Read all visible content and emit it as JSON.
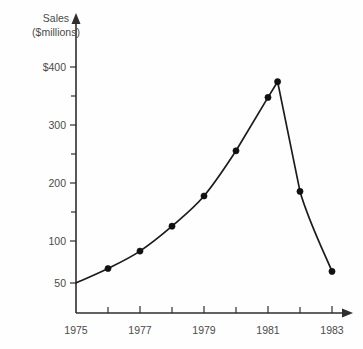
{
  "chart_data": {
    "type": "line",
    "title": "",
    "ylabel": "Sales\n($millions)",
    "ylabel_line1": "Sales",
    "ylabel_line2": "($millions)",
    "xlabel": "",
    "x": [
      1975,
      1976,
      1977,
      1978,
      1979,
      1980,
      1981,
      1981.3,
      1982,
      1983
    ],
    "values": [
      50,
      75,
      105,
      148,
      200,
      278,
      370,
      397,
      208,
      70
    ],
    "categories": [
      "1975",
      "1976",
      "1977",
      "1978",
      "1979",
      "1980",
      "1981",
      "1981",
      "1982",
      "1983"
    ],
    "xlim": [
      1975,
      1983
    ],
    "ylim": [
      0,
      420
    ],
    "grid": false,
    "legend": false,
    "x_tick_labels": [
      "1975",
      "",
      "1977",
      "",
      "1979",
      "",
      "1981",
      "",
      "1983"
    ],
    "x_tick_values": [
      1975,
      1976,
      1977,
      1978,
      1979,
      1980,
      1981,
      1982,
      1983
    ],
    "y_tick_labels": [
      "$400",
      "",
      "300",
      "",
      "200",
      "",
      "100",
      "50"
    ],
    "y_tick_values": [
      400,
      350,
      300,
      250,
      200,
      150,
      100,
      50
    ],
    "y_major_labels": [
      "$400",
      "300",
      "200",
      "100",
      "50"
    ],
    "y_major_values": [
      400,
      300,
      200,
      100,
      50
    ],
    "markers_shown_at": [
      1976,
      1977,
      1978,
      1979,
      1980,
      1981,
      1981.3,
      1982,
      1983
    ],
    "series": [
      {
        "name": "Sales",
        "points": [
          {
            "year": "1975",
            "value": 50,
            "marker": false
          },
          {
            "year": "1976",
            "value": 75,
            "marker": true
          },
          {
            "year": "1977",
            "value": 105,
            "marker": true
          },
          {
            "year": "1978",
            "value": 148,
            "marker": true
          },
          {
            "year": "1979",
            "value": 200,
            "marker": true
          },
          {
            "year": "1980",
            "value": 278,
            "marker": true
          },
          {
            "year": "1981",
            "value": 370,
            "marker": true
          },
          {
            "year": "1981+",
            "value": 397,
            "marker": true
          },
          {
            "year": "1982",
            "value": 208,
            "marker": true
          },
          {
            "year": "1983",
            "value": 70,
            "marker": true
          }
        ]
      }
    ],
    "colors": {
      "line": "#1c1c1c",
      "marker": "#111111",
      "axis": "#2e2e2e",
      "text": "#4a4a4a",
      "background": "#fefefe"
    }
  },
  "axis_labels": {
    "y_title_line1": "Sales",
    "y_title_line2": "($millions)",
    "y_ticks": [
      {
        "label": "$400",
        "value": 400
      },
      {
        "label": "300",
        "value": 300
      },
      {
        "label": "200",
        "value": 200
      },
      {
        "label": "100",
        "value": 100
      },
      {
        "label": "50",
        "value": 50
      }
    ],
    "x_ticks": [
      {
        "label": "1975",
        "value": 1975
      },
      {
        "label": "1977",
        "value": 1977
      },
      {
        "label": "1979",
        "value": 1979
      },
      {
        "label": "1981",
        "value": 1981
      },
      {
        "label": "1983",
        "value": 1983
      }
    ]
  }
}
